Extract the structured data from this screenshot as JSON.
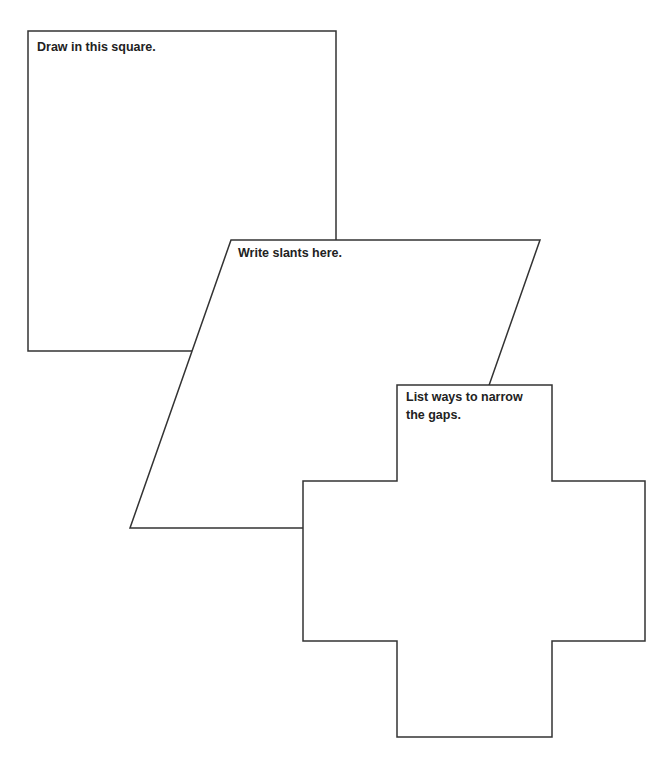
{
  "worksheet": {
    "shapes": [
      {
        "id": "square",
        "type": "square",
        "prompt": "Draw in this square.",
        "points": [
          [
            28,
            31
          ],
          [
            336,
            31
          ],
          [
            336,
            351
          ],
          [
            28,
            351
          ]
        ]
      },
      {
        "id": "parallelogram",
        "type": "parallelogram",
        "prompt": "Write slants here.",
        "points": [
          [
            231,
            240
          ],
          [
            540,
            240
          ],
          [
            439,
            528
          ],
          [
            130,
            528
          ]
        ]
      },
      {
        "id": "cross",
        "type": "cross",
        "prompt": "List ways to narrow\nthe gaps.",
        "points": [
          [
            397,
            385
          ],
          [
            552,
            385
          ],
          [
            552,
            481
          ],
          [
            645,
            481
          ],
          [
            645,
            641
          ],
          [
            552,
            641
          ],
          [
            552,
            737
          ],
          [
            397,
            737
          ],
          [
            397,
            641
          ],
          [
            303,
            641
          ],
          [
            303,
            481
          ],
          [
            397,
            481
          ]
        ]
      }
    ],
    "colors": {
      "stroke": "#333333",
      "fill": "#ffffff",
      "text": "#222222",
      "background": "#ffffff"
    }
  }
}
